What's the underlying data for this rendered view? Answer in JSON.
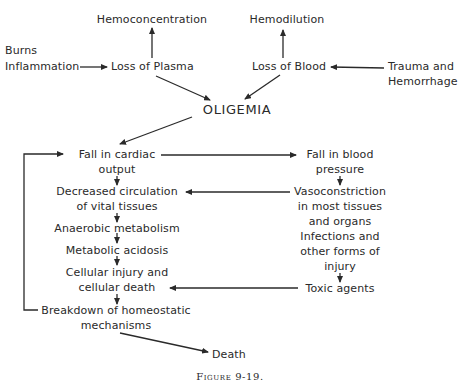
{
  "figure": {
    "caption": "Figure 9-19.",
    "colors": {
      "background": "#ffffff",
      "ink": "#2a2a2a"
    }
  },
  "nodes": {
    "hemoconcentration": "Hemoconcentration",
    "hemodilution": "Hemodilution",
    "burns": "Burns",
    "inflammation": "Inflammation",
    "loss_of_plasma": "Loss of Plasma",
    "loss_of_blood": "Loss of Blood",
    "trauma_line1": "Trauma and",
    "trauma_line2": "Hemorrhage",
    "oligemia": "OLIGEMIA",
    "fall_cardiac_line1": "Fall in cardiac",
    "fall_cardiac_line2": "output",
    "fall_bp_line1": "Fall in blood",
    "fall_bp_line2": "pressure",
    "decreased_circ_line1": "Decreased circulation",
    "decreased_circ_line2": "of vital tissues",
    "vaso_line1": "Vasoconstriction",
    "vaso_line2": "in most tissues",
    "vaso_line3": "and organs",
    "infections_line1": "Infections and",
    "infections_line2": "other forms of",
    "infections_line3": "injury",
    "anaerobic": "Anaerobic metabolism",
    "acidosis": "Metabolic acidosis",
    "cellular_line1": "Cellular injury and",
    "cellular_line2": "cellular death",
    "toxic": "Toxic agents",
    "breakdown_line1": "Breakdown of homeostatic",
    "breakdown_line2": "mechanisms",
    "death": "Death"
  },
  "edges": [
    {
      "from": "Burns/Inflammation",
      "to": "Loss of Plasma"
    },
    {
      "from": "Trauma and Hemorrhage",
      "to": "Loss of Blood"
    },
    {
      "from": "Loss of Plasma",
      "to": "Hemoconcentration"
    },
    {
      "from": "Loss of Blood",
      "to": "Hemodilution"
    },
    {
      "from": "Loss of Plasma",
      "to": "OLIGEMIA"
    },
    {
      "from": "Loss of Blood",
      "to": "OLIGEMIA"
    },
    {
      "from": "OLIGEMIA",
      "to": "Fall in cardiac output"
    },
    {
      "from": "Fall in cardiac output",
      "to": "Fall in blood pressure"
    },
    {
      "from": "Fall in cardiac output",
      "to": "Decreased circulation of vital tissues"
    },
    {
      "from": "Fall in blood pressure",
      "to": "Vasoconstriction in most tissues and organs"
    },
    {
      "from": "Vasoconstriction in most tissues and organs",
      "to": "Decreased circulation of vital tissues"
    },
    {
      "from": "Decreased circulation of vital tissues",
      "to": "Anaerobic metabolism"
    },
    {
      "from": "Anaerobic metabolism",
      "to": "Metabolic acidosis"
    },
    {
      "from": "Metabolic acidosis",
      "to": "Cellular injury and cellular death"
    },
    {
      "from": "Infections and other forms of injury",
      "to": "Toxic agents"
    },
    {
      "from": "Toxic agents",
      "to": "Cellular injury and cellular death"
    },
    {
      "from": "Cellular injury and cellular death",
      "to": "Breakdown of homeostatic mechanisms"
    },
    {
      "from": "Breakdown of homeostatic mechanisms",
      "to": "Fall in cardiac output"
    },
    {
      "from": "Breakdown of homeostatic mechanisms",
      "to": "Death"
    }
  ]
}
